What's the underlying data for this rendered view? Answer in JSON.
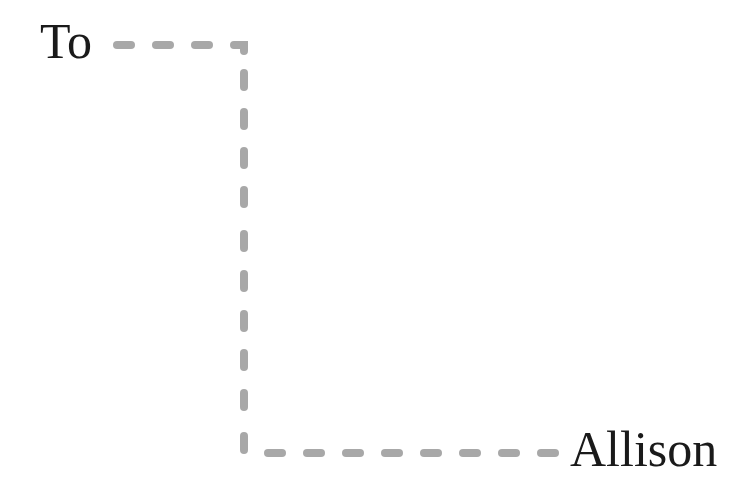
{
  "diagram": {
    "type": "flow-connector",
    "nodes": [
      {
        "id": "from",
        "label": "To"
      },
      {
        "id": "to",
        "label": "Allison"
      }
    ],
    "edges": [
      {
        "from": "from",
        "to": "to",
        "style": "dashed",
        "routing": "elbow (right, down, right)"
      }
    ],
    "colors": {
      "text": "#1a1a1a",
      "dash": "#a8a8a8",
      "background": "#ffffff"
    }
  }
}
